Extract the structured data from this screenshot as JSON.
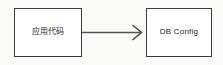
{
  "diagram": {
    "type": "flow-diagram",
    "background_color": "#fafaf9",
    "node_fill_color": "#ffffff",
    "node_border_color": "#3a3a3a",
    "connector_color": "#555555",
    "text_color": "#262626",
    "nodes": [
      {
        "id": "app-code",
        "label": "应用代码",
        "shape": "rectangle"
      },
      {
        "id": "db-config",
        "label": "DB Config",
        "shape": "rectangle"
      }
    ],
    "edges": [
      {
        "id": "app-code-to-db-config",
        "from": "app-code",
        "to": "db-config",
        "label": "",
        "arrowhead": "open-v",
        "style": "solid"
      }
    ]
  }
}
